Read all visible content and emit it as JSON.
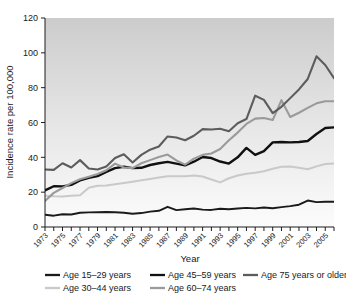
{
  "chart_data": {
    "type": "line",
    "title": "",
    "xlabel": "Year",
    "ylabel": "Incidence rate per 100,000",
    "xlim": [
      1973,
      2006
    ],
    "ylim": [
      0,
      120
    ],
    "yticks": [
      0,
      20,
      40,
      60,
      80,
      100,
      120
    ],
    "xticks": [
      1973,
      1975,
      1977,
      1979,
      1981,
      1983,
      1985,
      1987,
      1989,
      1991,
      1993,
      1995,
      1997,
      1999,
      2001,
      2003,
      2005
    ],
    "minor_xticks": "every year 1973-2006",
    "grid": false,
    "legend_position": "below",
    "x": [
      1973,
      1974,
      1975,
      1976,
      1977,
      1978,
      1979,
      1980,
      1981,
      1982,
      1983,
      1984,
      1985,
      1986,
      1987,
      1988,
      1989,
      1990,
      1991,
      1992,
      1993,
      1994,
      1995,
      1996,
      1997,
      1998,
      1999,
      2000,
      2001,
      2002,
      2003,
      2004,
      2005,
      2006
    ],
    "series": [
      {
        "name": "Age 15–29 years",
        "color": "#1a1a1a",
        "width": 1.9,
        "values": [
          7.0,
          6.5,
          7.3,
          7.2,
          8.2,
          8.4,
          8.5,
          8.6,
          8.5,
          8.2,
          7.6,
          8.0,
          8.8,
          9.3,
          11.6,
          9.7,
          10.2,
          10.6,
          10.0,
          9.8,
          10.5,
          10.2,
          10.6,
          11.0,
          10.7,
          11.2,
          10.8,
          11.4,
          12.0,
          12.8,
          15.2,
          14.3,
          14.5,
          14.5
        ]
      },
      {
        "name": "Age 30–44 years",
        "color": "#c9c9c9",
        "width": 2.0,
        "values": [
          18.0,
          17.6,
          17.5,
          18.0,
          18.2,
          22.5,
          23.7,
          23.8,
          24.5,
          25.2,
          26.0,
          26.8,
          27.6,
          28.4,
          29.2,
          29.1,
          29.2,
          29.5,
          29.0,
          27.3,
          25.6,
          28.0,
          29.6,
          30.6,
          31.2,
          32.0,
          33.4,
          34.6,
          34.8,
          34.0,
          33.2,
          34.8,
          36.2,
          36.4
        ]
      },
      {
        "name": "Age 45–59 years",
        "color": "#111111",
        "width": 2.4,
        "values": [
          21.0,
          23.4,
          23.3,
          24.2,
          26.8,
          28.2,
          29.2,
          31.6,
          33.8,
          34.6,
          33.8,
          34.0,
          35.6,
          36.6,
          37.4,
          36.4,
          35.4,
          37.5,
          40.2,
          39.6,
          37.6,
          36.4,
          40.0,
          45.4,
          41.4,
          43.6,
          48.6,
          48.8,
          48.6,
          48.8,
          49.4,
          53.4,
          56.8,
          57.2
        ]
      },
      {
        "name": "Age 60–74 years",
        "color": "#9a9a9a",
        "width": 2.1,
        "values": [
          15.0,
          19.6,
          22.4,
          25.2,
          27.4,
          28.8,
          30.4,
          32.6,
          36.4,
          34.2,
          33.8,
          36.6,
          38.4,
          40.2,
          41.6,
          38.2,
          35.8,
          39.2,
          41.4,
          42.2,
          44.8,
          49.8,
          54.2,
          59.2,
          62.2,
          62.6,
          61.4,
          72.8,
          63.2,
          65.6,
          68.4,
          71.0,
          72.2,
          72.2
        ]
      },
      {
        "name": "Age 75 years or older",
        "color": "#5c5c5c",
        "width": 2.1,
        "values": [
          33.0,
          32.8,
          36.6,
          34.2,
          38.4,
          33.6,
          33.0,
          34.8,
          39.6,
          41.8,
          37.0,
          41.4,
          44.4,
          46.2,
          52.0,
          51.4,
          49.8,
          52.4,
          56.2,
          56.0,
          56.4,
          55.0,
          59.6,
          62.0,
          75.4,
          73.0,
          65.4,
          69.0,
          74.0,
          79.0,
          85.0,
          98.0,
          93.0,
          85.4
        ]
      }
    ]
  },
  "axes": {
    "ylabel": "Incidence rate per 100,000",
    "xlabel": "Year",
    "ytick_labels": [
      "0",
      "20",
      "40",
      "60",
      "80",
      "100",
      "120"
    ],
    "xtick_labels": [
      "1973",
      "1975",
      "1977",
      "1979",
      "1981",
      "1983",
      "1985",
      "1987",
      "1989",
      "1991",
      "1993",
      "1995",
      "1997",
      "1999",
      "2001",
      "2003",
      "2005"
    ]
  },
  "legend": {
    "items": [
      {
        "label": "Age 15–29 years",
        "color": "#1a1a1a"
      },
      {
        "label": "Age 45–59 years",
        "color": "#111111"
      },
      {
        "label": "Age 75 years or older",
        "color": "#5c5c5c"
      },
      {
        "label": "Age 30–44 years",
        "color": "#c9c9c9"
      },
      {
        "label": "Age 60–74 years",
        "color": "#9a9a9a"
      }
    ]
  },
  "style": {
    "plot_bg_top": "#cfcfcf",
    "plot_bg_bottom": "#fbfbfb",
    "axis_color": "#1d1d1d"
  }
}
